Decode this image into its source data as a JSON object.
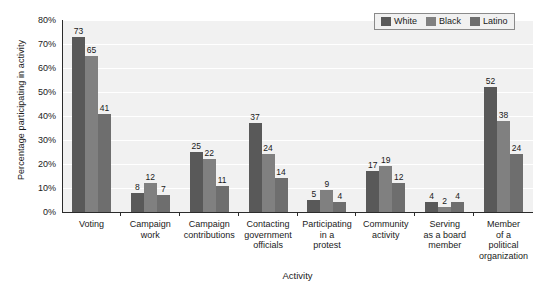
{
  "chart_data": {
    "type": "bar",
    "title": "",
    "xlabel": "Activity",
    "ylabel": "Percentage participating in activity",
    "ylim": [
      0,
      80
    ],
    "y_tick_labels": [
      "0%",
      "10%",
      "20%",
      "30%",
      "40%",
      "50%",
      "60%",
      "70%",
      "80%"
    ],
    "y_tick_values": [
      0,
      10,
      20,
      30,
      40,
      50,
      60,
      70,
      80
    ],
    "grid": true,
    "legend_position": "top-right",
    "categories": [
      "Voting",
      "Campaign work",
      "Campaign contributions",
      "Contacting government officials",
      "Participating in a protest",
      "Community activity",
      "Serving as a board member",
      "Member of a political organization"
    ],
    "category_label_lines": [
      [
        "Voting"
      ],
      [
        "Campaign",
        "work"
      ],
      [
        "Campaign",
        "contributions"
      ],
      [
        "Contacting",
        "government",
        "officials"
      ],
      [
        "Participating",
        "in a",
        "protest"
      ],
      [
        "Community",
        "activity"
      ],
      [
        "Serving",
        "as a board",
        "member"
      ],
      [
        "Member",
        "of a",
        "political",
        "organization"
      ]
    ],
    "series": [
      {
        "name": "White",
        "color": "#595959",
        "values": [
          73,
          8,
          25,
          37,
          5,
          17,
          4,
          52
        ]
      },
      {
        "name": "Black",
        "color": "#808080",
        "values": [
          65,
          12,
          22,
          24,
          9,
          19,
          2,
          38
        ]
      },
      {
        "name": "Latino",
        "color": "#6e6e6e",
        "values": [
          41,
          7,
          11,
          14,
          4,
          12,
          4,
          24
        ]
      }
    ]
  },
  "colors": {
    "plot_background": "#f1f1f1",
    "gridline": "#ffffff",
    "axis": "#2b2b2b",
    "text": "#1a1a1a",
    "legend_border": "#8a8a8a"
  }
}
